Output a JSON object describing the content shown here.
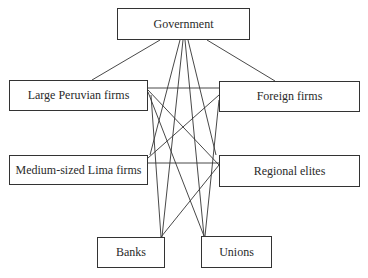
{
  "diagram": {
    "type": "network",
    "nodes": [
      {
        "id": "government",
        "label": "Government",
        "x": 117,
        "y": 8,
        "w": 133,
        "h": 32
      },
      {
        "id": "large_peruvian_firms",
        "label": "Large Peruvian firms",
        "x": 9,
        "y": 80,
        "w": 139,
        "h": 31
      },
      {
        "id": "foreign_firms",
        "label": "Foreign firms",
        "x": 219,
        "y": 81,
        "w": 141,
        "h": 31
      },
      {
        "id": "medium_lima_firms",
        "label": "Medium-sized Lima firms",
        "x": 9,
        "y": 155,
        "w": 139,
        "h": 30
      },
      {
        "id": "regional_elites",
        "label": "Regional elites",
        "x": 219,
        "y": 155,
        "w": 141,
        "h": 32
      },
      {
        "id": "banks",
        "label": "Banks",
        "x": 97,
        "y": 237,
        "w": 68,
        "h": 31
      },
      {
        "id": "unions",
        "label": "Unions",
        "x": 201,
        "y": 236,
        "w": 71,
        "h": 32
      }
    ],
    "edges": [
      {
        "from": "government",
        "to": "large_peruvian_firms",
        "x1": 160,
        "y1": 40,
        "x2": 92,
        "y2": 80
      },
      {
        "from": "government",
        "to": "foreign_firms",
        "x1": 207,
        "y1": 40,
        "x2": 275,
        "y2": 81
      },
      {
        "from": "government",
        "to": "medium_lima_firms",
        "x1": 180,
        "y1": 40,
        "x2": 150,
        "y2": 155
      },
      {
        "from": "government",
        "to": "banks",
        "x1": 183,
        "y1": 40,
        "x2": 162,
        "y2": 237
      },
      {
        "from": "government",
        "to": "unions",
        "x1": 185,
        "y1": 40,
        "x2": 204,
        "y2": 236
      },
      {
        "from": "government",
        "to": "regional_elites",
        "x1": 188,
        "y1": 40,
        "x2": 216,
        "y2": 155
      },
      {
        "from": "large_peruvian_firms",
        "to": "foreign_firms",
        "x1": 148,
        "y1": 88,
        "x2": 219,
        "y2": 88
      },
      {
        "from": "large_peruvian_firms",
        "to": "regional_elites",
        "x1": 148,
        "y1": 90,
        "x2": 219,
        "y2": 165
      },
      {
        "from": "large_peruvian_firms",
        "to": "unions",
        "x1": 148,
        "y1": 92,
        "x2": 204,
        "y2": 236
      },
      {
        "from": "large_peruvian_firms",
        "to": "banks",
        "x1": 151,
        "y1": 95,
        "x2": 161,
        "y2": 237
      },
      {
        "from": "foreign_firms",
        "to": "medium_lima_firms",
        "x1": 219,
        "y1": 95,
        "x2": 148,
        "y2": 158
      },
      {
        "from": "foreign_firms",
        "to": "unions",
        "x1": 219,
        "y1": 100,
        "x2": 205,
        "y2": 236
      },
      {
        "from": "medium_lima_firms",
        "to": "regional_elites",
        "x1": 148,
        "y1": 163,
        "x2": 219,
        "y2": 163
      },
      {
        "from": "regional_elites",
        "to": "banks",
        "x1": 219,
        "y1": 165,
        "x2": 161,
        "y2": 237
      }
    ]
  }
}
